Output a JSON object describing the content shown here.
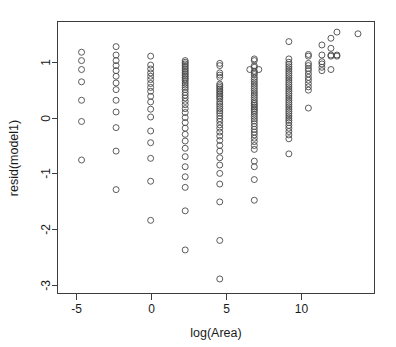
{
  "chart_data": {
    "type": "scatter",
    "title": "",
    "xlabel": "log(Area)",
    "ylabel": "resid(model1)",
    "xlim": [
      -6.2,
      14.9
    ],
    "ylim": [
      -3.15,
      1.72
    ],
    "xticks": [
      -5,
      0,
      5,
      10
    ],
    "xticklabels": [
      "-5",
      "0",
      "5",
      "10"
    ],
    "yticks": [
      1,
      0,
      -1,
      -2,
      -3
    ],
    "yticklabels": [
      "1",
      "0",
      "-1",
      "-2",
      "-3"
    ],
    "grid": false,
    "legend": false,
    "marker": "open-circle",
    "marker_color": "#4a4a4a",
    "marker_radius_px": 3.0,
    "background": "#ffffff",
    "frame": true,
    "series": [
      {
        "name": "residuals",
        "points": [
          [
            -4.6,
            1.17
          ],
          [
            -4.6,
            1.02
          ],
          [
            -4.6,
            0.86
          ],
          [
            -4.6,
            0.64
          ],
          [
            -4.6,
            0.31
          ],
          [
            -4.6,
            -0.07
          ],
          [
            -4.6,
            -0.76
          ],
          [
            -2.3,
            1.27
          ],
          [
            -2.3,
            1.12
          ],
          [
            -2.3,
            1.02
          ],
          [
            -2.3,
            0.93
          ],
          [
            -2.3,
            0.84
          ],
          [
            -2.3,
            0.74
          ],
          [
            -2.3,
            0.62
          ],
          [
            -2.3,
            0.5
          ],
          [
            -2.3,
            0.31
          ],
          [
            -2.3,
            0.1
          ],
          [
            -2.3,
            -0.18
          ],
          [
            -2.3,
            -0.6
          ],
          [
            -2.3,
            -1.29
          ],
          [
            0.0,
            1.1
          ],
          [
            0.0,
            0.94
          ],
          [
            0.0,
            0.87
          ],
          [
            0.0,
            0.8
          ],
          [
            0.0,
            0.74
          ],
          [
            0.0,
            0.68
          ],
          [
            0.0,
            0.61
          ],
          [
            0.0,
            0.54
          ],
          [
            0.0,
            0.47
          ],
          [
            0.0,
            0.38
          ],
          [
            0.0,
            0.28
          ],
          [
            0.0,
            0.15
          ],
          [
            0.0,
            0.01
          ],
          [
            0.0,
            -0.24
          ],
          [
            0.0,
            -0.45
          ],
          [
            0.0,
            -0.73
          ],
          [
            0.0,
            -1.14
          ],
          [
            0.0,
            -1.84
          ],
          [
            2.3,
            1.02
          ],
          [
            2.3,
            0.99
          ],
          [
            2.3,
            0.96
          ],
          [
            2.3,
            0.93
          ],
          [
            2.3,
            0.9
          ],
          [
            2.3,
            0.87
          ],
          [
            2.3,
            0.84
          ],
          [
            2.3,
            0.81
          ],
          [
            2.3,
            0.78
          ],
          [
            2.3,
            0.75
          ],
          [
            2.3,
            0.72
          ],
          [
            2.3,
            0.69
          ],
          [
            2.3,
            0.66
          ],
          [
            2.3,
            0.62
          ],
          [
            2.3,
            0.58
          ],
          [
            2.3,
            0.54
          ],
          [
            2.3,
            0.5
          ],
          [
            2.3,
            0.45
          ],
          [
            2.3,
            0.4
          ],
          [
            2.3,
            0.35
          ],
          [
            2.3,
            0.29
          ],
          [
            2.3,
            0.23
          ],
          [
            2.3,
            0.16
          ],
          [
            2.3,
            0.09
          ],
          [
            2.3,
            0.0
          ],
          [
            2.3,
            -0.09
          ],
          [
            2.3,
            -0.19
          ],
          [
            2.3,
            -0.3
          ],
          [
            2.3,
            -0.42
          ],
          [
            2.3,
            -0.55
          ],
          [
            2.3,
            -0.7
          ],
          [
            2.3,
            -0.88
          ],
          [
            2.3,
            -1.06
          ],
          [
            2.3,
            -1.25
          ],
          [
            2.3,
            -1.67
          ],
          [
            2.3,
            -2.37
          ],
          [
            4.6,
            0.97
          ],
          [
            4.6,
            0.93
          ],
          [
            4.6,
            0.8
          ],
          [
            4.6,
            0.76
          ],
          [
            4.6,
            0.72
          ],
          [
            4.6,
            0.6
          ],
          [
            4.6,
            0.57
          ],
          [
            4.6,
            0.54
          ],
          [
            4.6,
            0.51
          ],
          [
            4.6,
            0.48
          ],
          [
            4.6,
            0.45
          ],
          [
            4.6,
            0.42
          ],
          [
            4.6,
            0.39
          ],
          [
            4.6,
            0.36
          ],
          [
            4.6,
            0.33
          ],
          [
            4.6,
            0.28
          ],
          [
            4.6,
            0.24
          ],
          [
            4.6,
            0.2
          ],
          [
            4.6,
            0.16
          ],
          [
            4.6,
            0.12
          ],
          [
            4.6,
            0.08
          ],
          [
            4.6,
            0.03
          ],
          [
            4.6,
            -0.02
          ],
          [
            4.6,
            -0.07
          ],
          [
            4.6,
            -0.13
          ],
          [
            4.6,
            -0.19
          ],
          [
            4.6,
            -0.26
          ],
          [
            4.6,
            -0.33
          ],
          [
            4.6,
            -0.41
          ],
          [
            4.6,
            -0.5
          ],
          [
            4.6,
            -0.6
          ],
          [
            4.6,
            -0.72
          ],
          [
            4.6,
            -0.85
          ],
          [
            4.6,
            -1.0
          ],
          [
            4.6,
            -1.19
          ],
          [
            4.6,
            -1.51
          ],
          [
            4.6,
            -2.2
          ],
          [
            4.6,
            -2.89
          ],
          [
            6.9,
            1.05
          ],
          [
            6.9,
            1.02
          ],
          [
            6.9,
            0.93
          ],
          [
            6.9,
            0.9
          ],
          [
            6.9,
            0.83
          ],
          [
            6.9,
            0.8
          ],
          [
            6.9,
            0.77
          ],
          [
            6.9,
            0.72
          ],
          [
            6.9,
            0.68
          ],
          [
            6.9,
            0.64
          ],
          [
            6.9,
            0.6
          ],
          [
            6.9,
            0.56
          ],
          [
            6.9,
            0.52
          ],
          [
            6.9,
            0.48
          ],
          [
            6.9,
            0.44
          ],
          [
            6.9,
            0.4
          ],
          [
            6.9,
            0.36
          ],
          [
            6.9,
            0.32
          ],
          [
            6.9,
            0.28
          ],
          [
            6.9,
            0.25
          ],
          [
            6.9,
            0.22
          ],
          [
            6.9,
            0.19
          ],
          [
            6.9,
            0.16
          ],
          [
            6.9,
            0.13
          ],
          [
            6.9,
            0.1
          ],
          [
            6.9,
            0.06
          ],
          [
            6.9,
            0.02
          ],
          [
            6.9,
            -0.02
          ],
          [
            6.9,
            -0.06
          ],
          [
            6.9,
            -0.11
          ],
          [
            6.9,
            -0.16
          ],
          [
            6.9,
            -0.21
          ],
          [
            6.9,
            -0.26
          ],
          [
            6.9,
            -0.31
          ],
          [
            6.9,
            -0.37
          ],
          [
            6.9,
            -0.43
          ],
          [
            6.9,
            -0.5
          ],
          [
            6.9,
            -0.57
          ],
          [
            6.9,
            -0.78
          ],
          [
            6.9,
            -0.88
          ],
          [
            6.9,
            -1.11
          ],
          [
            6.9,
            -1.48
          ],
          [
            6.6,
            0.86
          ],
          [
            7.2,
            0.86
          ],
          [
            9.2,
            1.36
          ],
          [
            9.2,
            1.05
          ],
          [
            9.2,
            0.99
          ],
          [
            9.2,
            0.95
          ],
          [
            9.2,
            0.91
          ],
          [
            9.2,
            0.87
          ],
          [
            9.2,
            0.83
          ],
          [
            9.2,
            0.79
          ],
          [
            9.2,
            0.75
          ],
          [
            9.2,
            0.71
          ],
          [
            9.2,
            0.67
          ],
          [
            9.2,
            0.63
          ],
          [
            9.2,
            0.59
          ],
          [
            9.2,
            0.55
          ],
          [
            9.2,
            0.51
          ],
          [
            9.2,
            0.47
          ],
          [
            9.2,
            0.43
          ],
          [
            9.2,
            0.39
          ],
          [
            9.2,
            0.35
          ],
          [
            9.2,
            0.31
          ],
          [
            9.2,
            0.27
          ],
          [
            9.2,
            0.23
          ],
          [
            9.2,
            0.19
          ],
          [
            9.2,
            0.15
          ],
          [
            9.2,
            0.11
          ],
          [
            9.2,
            0.07
          ],
          [
            9.2,
            0.03
          ],
          [
            9.2,
            -0.01
          ],
          [
            9.2,
            -0.05
          ],
          [
            9.2,
            -0.09
          ],
          [
            9.2,
            -0.14
          ],
          [
            9.2,
            -0.19
          ],
          [
            9.2,
            -0.25
          ],
          [
            9.2,
            -0.31
          ],
          [
            9.2,
            -0.38
          ],
          [
            9.2,
            -0.65
          ],
          [
            10.5,
            1.13
          ],
          [
            10.5,
            1.1
          ],
          [
            10.5,
            0.97
          ],
          [
            10.5,
            0.93
          ],
          [
            10.5,
            0.88
          ],
          [
            10.5,
            0.84
          ],
          [
            10.5,
            0.78
          ],
          [
            10.5,
            0.72
          ],
          [
            10.5,
            0.67
          ],
          [
            10.5,
            0.61
          ],
          [
            10.5,
            0.55
          ],
          [
            10.5,
            0.49
          ],
          [
            10.5,
            0.17
          ],
          [
            11.4,
            1.3
          ],
          [
            11.4,
            1.12
          ],
          [
            11.4,
            1.0
          ],
          [
            11.4,
            0.96
          ],
          [
            11.4,
            0.9
          ],
          [
            11.4,
            0.84
          ],
          [
            12.0,
            1.42
          ],
          [
            12.0,
            1.24
          ],
          [
            12.0,
            1.12
          ],
          [
            12.0,
            1.1
          ],
          [
            12.0,
            0.86
          ],
          [
            12.4,
            1.53
          ],
          [
            12.4,
            1.12
          ],
          [
            12.4,
            1.1
          ],
          [
            13.8,
            1.5
          ]
        ]
      }
    ]
  },
  "axes": {
    "x_axis_name": "x-axis",
    "y_axis_name": "y-axis"
  }
}
